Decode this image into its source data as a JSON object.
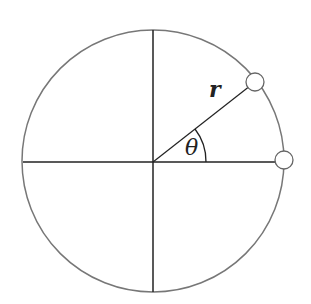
{
  "diagram": {
    "labels": {
      "radius": "r",
      "angle": "θ"
    },
    "colors": {
      "circle": "#777777",
      "lines": "#222222",
      "points_fill": "#ffffff"
    }
  }
}
